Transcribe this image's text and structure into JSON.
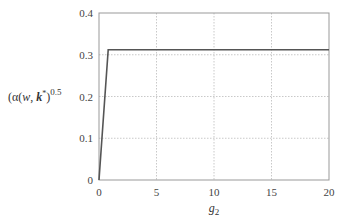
{
  "chart_data": {
    "type": "line",
    "title": "",
    "xlabel": "g2",
    "xlabel_main": "g",
    "xlabel_sub": "2",
    "ylabel": "(α(w, k*)^0.5",
    "ylabel_parts": {
      "prefix": "(α(",
      "w": "w",
      "sep": ", ",
      "k": "k",
      "star": "*",
      "close": ")",
      "exp": "0.5"
    },
    "xlim": [
      0,
      20
    ],
    "ylim": [
      0,
      0.4
    ],
    "xticks": [
      0,
      5,
      10,
      15,
      20
    ],
    "xtick_labels": [
      "0",
      "5",
      "10",
      "15",
      "20"
    ],
    "yticks": [
      0,
      0.1,
      0.2,
      0.3,
      0.4
    ],
    "ytick_labels": [
      "0",
      "0.1",
      "0.2",
      "0.3",
      "0.4"
    ],
    "grid": true,
    "legend": null,
    "series": [
      {
        "name": "(α(w, k*))^0.5",
        "color": "#555555",
        "x": [
          0,
          0.8,
          20
        ],
        "y": [
          0,
          0.312,
          0.312
        ]
      }
    ]
  }
}
